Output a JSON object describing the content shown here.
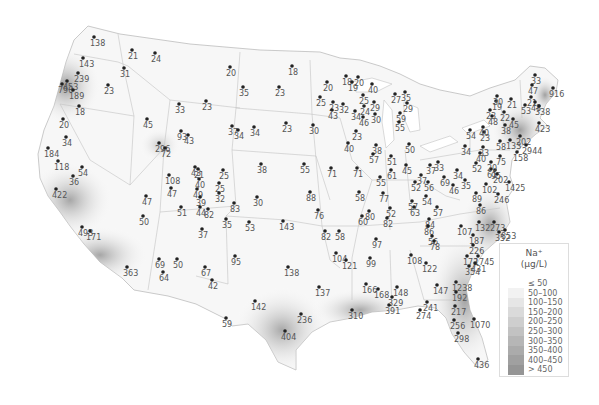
{
  "map": {
    "title": "Na+ concentrations (µg/L)",
    "region": "Contiguous United States"
  },
  "legend": {
    "title_line1": "Na⁺",
    "title_line2": "(µg/L)",
    "bins": [
      {
        "label": "≤ 50",
        "color": "#ffffff"
      },
      {
        "label": "50–100",
        "color": "#f2f2f2"
      },
      {
        "label": "100–150",
        "color": "#e6e6e6"
      },
      {
        "label": "150–200",
        "color": "#dadada"
      },
      {
        "label": "200–250",
        "color": "#cecece"
      },
      {
        "label": "250–300",
        "color": "#c2c2c2"
      },
      {
        "label": "300–350",
        "color": "#b6b6b6"
      },
      {
        "label": "350–400",
        "color": "#ababab"
      },
      {
        "label": "400–450",
        "color": "#a0a0a0"
      },
      {
        "label": "> 450",
        "color": "#959595"
      }
    ]
  },
  "stations": [
    {
      "v": "138",
      "x": 94,
      "y": 37
    },
    {
      "v": "21",
      "x": 132,
      "y": 50
    },
    {
      "v": "24",
      "x": 155,
      "y": 53
    },
    {
      "v": "31",
      "x": 124,
      "y": 68
    },
    {
      "v": "143",
      "x": 83,
      "y": 58
    },
    {
      "v": "239",
      "x": 78,
      "y": 73
    },
    {
      "v": "453",
      "x": 67,
      "y": 81
    },
    {
      "v": "790",
      "x": 62,
      "y": 84
    },
    {
      "v": "189",
      "x": 73,
      "y": 90
    },
    {
      "v": "23",
      "x": 108,
      "y": 85
    },
    {
      "v": "18",
      "x": 79,
      "y": 106
    },
    {
      "v": "20",
      "x": 63,
      "y": 119
    },
    {
      "v": "45",
      "x": 147,
      "y": 119
    },
    {
      "v": "34",
      "x": 66,
      "y": 137
    },
    {
      "v": "184",
      "x": 48,
      "y": 148
    },
    {
      "v": "118",
      "x": 58,
      "y": 161
    },
    {
      "v": "54",
      "x": 82,
      "y": 167
    },
    {
      "v": "36",
      "x": 73,
      "y": 176
    },
    {
      "v": "422",
      "x": 56,
      "y": 189
    },
    {
      "v": "47",
      "x": 146,
      "y": 196
    },
    {
      "v": "50",
      "x": 143,
      "y": 216
    },
    {
      "v": "493",
      "x": 82,
      "y": 227
    },
    {
      "v": "171",
      "x": 90,
      "y": 231
    },
    {
      "v": "363",
      "x": 127,
      "y": 267
    },
    {
      "v": "69",
      "x": 159,
      "y": 259
    },
    {
      "v": "64",
      "x": 163,
      "y": 272
    },
    {
      "v": "50",
      "x": 177,
      "y": 259
    },
    {
      "v": "67",
      "x": 205,
      "y": 267
    },
    {
      "v": "42",
      "x": 212,
      "y": 280
    },
    {
      "v": "95",
      "x": 235,
      "y": 256
    },
    {
      "v": "37",
      "x": 202,
      "y": 229
    },
    {
      "v": "35",
      "x": 226,
      "y": 219
    },
    {
      "v": "20",
      "x": 230,
      "y": 67
    },
    {
      "v": "18",
      "x": 292,
      "y": 66
    },
    {
      "v": "35",
      "x": 243,
      "y": 87
    },
    {
      "v": "23",
      "x": 279,
      "y": 87
    },
    {
      "v": "23",
      "x": 206,
      "y": 101
    },
    {
      "v": "33",
      "x": 179,
      "y": 104
    },
    {
      "v": "93",
      "x": 181,
      "y": 131
    },
    {
      "v": "43",
      "x": 188,
      "y": 135
    },
    {
      "v": "296",
      "x": 159,
      "y": 143
    },
    {
      "v": "72",
      "x": 165,
      "y": 148
    },
    {
      "v": "37",
      "x": 232,
      "y": 126
    },
    {
      "v": "34",
      "x": 238,
      "y": 130
    },
    {
      "v": "34",
      "x": 254,
      "y": 127
    },
    {
      "v": "23",
      "x": 286,
      "y": 123
    },
    {
      "v": "38",
      "x": 261,
      "y": 164
    },
    {
      "v": "55",
      "x": 304,
      "y": 164
    },
    {
      "v": "30",
      "x": 257,
      "y": 197
    },
    {
      "v": "88",
      "x": 310,
      "y": 192
    },
    {
      "v": "76",
      "x": 318,
      "y": 210
    },
    {
      "v": "53",
      "x": 249,
      "y": 222
    },
    {
      "v": "143",
      "x": 283,
      "y": 221
    },
    {
      "v": "138",
      "x": 288,
      "y": 267
    },
    {
      "v": "108",
      "x": 169,
      "y": 175
    },
    {
      "v": "47",
      "x": 171,
      "y": 188
    },
    {
      "v": "51",
      "x": 181,
      "y": 207
    },
    {
      "v": "43",
      "x": 195,
      "y": 167
    },
    {
      "v": "21",
      "x": 198,
      "y": 169
    },
    {
      "v": "25",
      "x": 223,
      "y": 170
    },
    {
      "v": "40",
      "x": 199,
      "y": 179
    },
    {
      "v": "25",
      "x": 219,
      "y": 183
    },
    {
      "v": "49",
      "x": 197,
      "y": 189
    },
    {
      "v": "39",
      "x": 200,
      "y": 197
    },
    {
      "v": "32",
      "x": 219,
      "y": 193
    },
    {
      "v": "44",
      "x": 200,
      "y": 207
    },
    {
      "v": "82",
      "x": 208,
      "y": 209
    },
    {
      "v": "83",
      "x": 234,
      "y": 203
    },
    {
      "v": "20",
      "x": 327,
      "y": 82
    },
    {
      "v": "18",
      "x": 346,
      "y": 76
    },
    {
      "v": "20",
      "x": 358,
      "y": 77
    },
    {
      "v": "19",
      "x": 352,
      "y": 82
    },
    {
      "v": "40",
      "x": 372,
      "y": 84
    },
    {
      "v": "25",
      "x": 320,
      "y": 97
    },
    {
      "v": "23",
      "x": 333,
      "y": 102
    },
    {
      "v": "43",
      "x": 332,
      "y": 110
    },
    {
      "v": "32",
      "x": 343,
      "y": 104
    },
    {
      "v": "34",
      "x": 355,
      "y": 111
    },
    {
      "v": "24",
      "x": 364,
      "y": 106
    },
    {
      "v": "25",
      "x": 363,
      "y": 95
    },
    {
      "v": "29",
      "x": 374,
      "y": 102
    },
    {
      "v": "30",
      "x": 375,
      "y": 114
    },
    {
      "v": "46",
      "x": 363,
      "y": 117
    },
    {
      "v": "27",
      "x": 395,
      "y": 94
    },
    {
      "v": "35",
      "x": 405,
      "y": 92
    },
    {
      "v": "29",
      "x": 407,
      "y": 103
    },
    {
      "v": "59",
      "x": 400,
      "y": 113
    },
    {
      "v": "55",
      "x": 399,
      "y": 122
    },
    {
      "v": "30",
      "x": 313,
      "y": 125
    },
    {
      "v": "23",
      "x": 356,
      "y": 131
    },
    {
      "v": "40",
      "x": 348,
      "y": 143
    },
    {
      "v": "38",
      "x": 376,
      "y": 145
    },
    {
      "v": "57",
      "x": 373,
      "y": 154
    },
    {
      "v": "50",
      "x": 409,
      "y": 144
    },
    {
      "v": "71",
      "x": 331,
      "y": 168
    },
    {
      "v": "71",
      "x": 357,
      "y": 168
    },
    {
      "v": "55",
      "x": 380,
      "y": 177
    },
    {
      "v": "51",
      "x": 391,
      "y": 156
    },
    {
      "v": "61",
      "x": 391,
      "y": 170
    },
    {
      "v": "45",
      "x": 406,
      "y": 165
    },
    {
      "v": "58",
      "x": 359,
      "y": 192
    },
    {
      "v": "77",
      "x": 383,
      "y": 193
    },
    {
      "v": "80",
      "x": 369,
      "y": 211
    },
    {
      "v": "52",
      "x": 390,
      "y": 208
    },
    {
      "v": "82",
      "x": 387,
      "y": 218
    },
    {
      "v": "60",
      "x": 362,
      "y": 216
    },
    {
      "v": "57",
      "x": 412,
      "y": 201
    },
    {
      "v": "63",
      "x": 414,
      "y": 207
    },
    {
      "v": "52",
      "x": 415,
      "y": 182
    },
    {
      "v": "54",
      "x": 426,
      "y": 196
    },
    {
      "v": "56",
      "x": 428,
      "y": 182
    },
    {
      "v": "57",
      "x": 437,
      "y": 207
    },
    {
      "v": "37",
      "x": 421,
      "y": 175
    },
    {
      "v": "37",
      "x": 430,
      "y": 165
    },
    {
      "v": "33",
      "x": 438,
      "y": 162
    },
    {
      "v": "69",
      "x": 444,
      "y": 177
    },
    {
      "v": "84",
      "x": 429,
      "y": 219
    },
    {
      "v": "86",
      "x": 428,
      "y": 226
    },
    {
      "v": "56",
      "x": 432,
      "y": 236
    },
    {
      "v": "78",
      "x": 434,
      "y": 241
    },
    {
      "v": "97",
      "x": 376,
      "y": 239
    },
    {
      "v": "82",
      "x": 325,
      "y": 231
    },
    {
      "v": "58",
      "x": 339,
      "y": 231
    },
    {
      "v": "104",
      "x": 336,
      "y": 253
    },
    {
      "v": "121",
      "x": 346,
      "y": 260
    },
    {
      "v": "99",
      "x": 370,
      "y": 258
    },
    {
      "v": "166",
      "x": 366,
      "y": 284
    },
    {
      "v": "168",
      "x": 378,
      "y": 289
    },
    {
      "v": "108",
      "x": 411,
      "y": 255
    },
    {
      "v": "148",
      "x": 397,
      "y": 287
    },
    {
      "v": "137",
      "x": 319,
      "y": 287
    },
    {
      "v": "142",
      "x": 255,
      "y": 301
    },
    {
      "v": "59",
      "x": 226,
      "y": 318
    },
    {
      "v": "236",
      "x": 301,
      "y": 314
    },
    {
      "v": "404",
      "x": 285,
      "y": 331
    },
    {
      "v": "310",
      "x": 352,
      "y": 310
    },
    {
      "v": "329",
      "x": 392,
      "y": 297
    },
    {
      "v": "391",
      "x": 389,
      "y": 305
    },
    {
      "v": "122",
      "x": 426,
      "y": 263
    },
    {
      "v": "147",
      "x": 437,
      "y": 285
    },
    {
      "v": "241",
      "x": 427,
      "y": 302
    },
    {
      "v": "274",
      "x": 420,
      "y": 310
    },
    {
      "v": "1238",
      "x": 456,
      "y": 282
    },
    {
      "v": "192",
      "x": 456,
      "y": 292
    },
    {
      "v": "217",
      "x": 455,
      "y": 306
    },
    {
      "v": "1070",
      "x": 474,
      "y": 319
    },
    {
      "v": "256",
      "x": 454,
      "y": 320
    },
    {
      "v": "298",
      "x": 458,
      "y": 333
    },
    {
      "v": "436",
      "x": 478,
      "y": 359
    },
    {
      "v": "172",
      "x": 467,
      "y": 256
    },
    {
      "v": "1745",
      "x": 478,
      "y": 256
    },
    {
      "v": "354",
      "x": 469,
      "y": 266
    },
    {
      "v": "431",
      "x": 475,
      "y": 263
    },
    {
      "v": "107",
      "x": 461,
      "y": 226
    },
    {
      "v": "187",
      "x": 473,
      "y": 235
    },
    {
      "v": "226",
      "x": 473,
      "y": 245
    },
    {
      "v": "132",
      "x": 479,
      "y": 222
    },
    {
      "v": "273",
      "x": 494,
      "y": 222
    },
    {
      "v": "352",
      "x": 499,
      "y": 232
    },
    {
      "v": "853",
      "x": 505,
      "y": 230
    },
    {
      "v": "86",
      "x": 480,
      "y": 205
    },
    {
      "v": "89",
      "x": 476,
      "y": 193
    },
    {
      "v": "246",
      "x": 498,
      "y": 194
    },
    {
      "v": "102",
      "x": 486,
      "y": 184
    },
    {
      "v": "1425",
      "x": 509,
      "y": 182
    },
    {
      "v": "35",
      "x": 465,
      "y": 180
    },
    {
      "v": "46",
      "x": 453,
      "y": 185
    },
    {
      "v": "34",
      "x": 457,
      "y": 170
    },
    {
      "v": "61",
      "x": 491,
      "y": 169
    },
    {
      "v": "95",
      "x": 495,
      "y": 170
    },
    {
      "v": "202",
      "x": 497,
      "y": 174
    },
    {
      "v": "20",
      "x": 491,
      "y": 162
    },
    {
      "v": "75",
      "x": 500,
      "y": 156
    },
    {
      "v": "158",
      "x": 517,
      "y": 152
    },
    {
      "v": "52",
      "x": 476,
      "y": 163
    },
    {
      "v": "40",
      "x": 480,
      "y": 153
    },
    {
      "v": "34",
      "x": 465,
      "y": 146
    },
    {
      "v": "33",
      "x": 483,
      "y": 147
    },
    {
      "v": "58",
      "x": 500,
      "y": 141
    },
    {
      "v": "54",
      "x": 470,
      "y": 130
    },
    {
      "v": "23",
      "x": 484,
      "y": 132
    },
    {
      "v": "40",
      "x": 483,
      "y": 127
    },
    {
      "v": "38",
      "x": 505,
      "y": 125
    },
    {
      "v": "133",
      "x": 510,
      "y": 140
    },
    {
      "v": "202",
      "x": 520,
      "y": 136
    },
    {
      "v": "2944",
      "x": 526,
      "y": 145
    },
    {
      "v": "423",
      "x": 539,
      "y": 123
    },
    {
      "v": "45",
      "x": 513,
      "y": 119
    },
    {
      "v": "48",
      "x": 492,
      "y": 116
    },
    {
      "v": "23",
      "x": 490,
      "y": 110
    },
    {
      "v": "22",
      "x": 504,
      "y": 112
    },
    {
      "v": "19",
      "x": 496,
      "y": 101
    },
    {
      "v": "30",
      "x": 497,
      "y": 96
    },
    {
      "v": "21",
      "x": 511,
      "y": 99
    },
    {
      "v": "21",
      "x": 531,
      "y": 97
    },
    {
      "v": "53",
      "x": 525,
      "y": 105
    },
    {
      "v": "48",
      "x": 535,
      "y": 102
    },
    {
      "v": "338",
      "x": 539,
      "y": 106
    },
    {
      "v": "916",
      "x": 553,
      "y": 88
    },
    {
      "v": "47",
      "x": 532,
      "y": 85
    },
    {
      "v": "33",
      "x": 535,
      "y": 75
    }
  ]
}
